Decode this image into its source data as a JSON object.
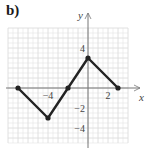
{
  "figure": {
    "part_label": "b)"
  },
  "chart_data": {
    "type": "line",
    "title": "",
    "xlabel": "x",
    "ylabel": "y",
    "xlim": [
      -8,
      4
    ],
    "ylim": [
      -5.5,
      6
    ],
    "grid": true,
    "grid_minor_step": 0.5,
    "x_tick_labels": [
      {
        "value": -4,
        "label": "−4"
      },
      {
        "value": 2,
        "label": "2"
      }
    ],
    "y_tick_labels": [
      {
        "value": 4,
        "label": "4"
      },
      {
        "value": -2,
        "label": "−2"
      },
      {
        "value": -4,
        "label": "−4"
      }
    ],
    "series": [
      {
        "name": "piecewise",
        "color": "#222222",
        "points": [
          [
            -7,
            0
          ],
          [
            -4,
            -3
          ],
          [
            -2,
            0
          ],
          [
            0,
            3
          ],
          [
            3,
            0
          ]
        ],
        "markers": "filled-circle"
      }
    ],
    "legend": null
  },
  "colors": {
    "grid": "#dcdcdc",
    "axis": "#777777",
    "line": "#222222"
  }
}
